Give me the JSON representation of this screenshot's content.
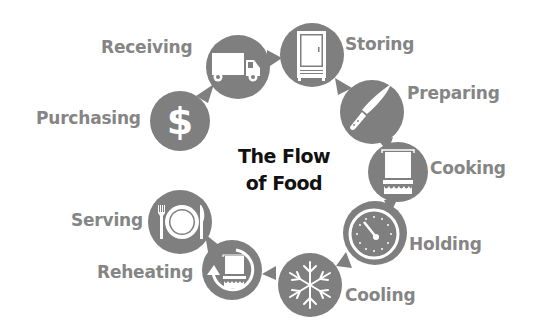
{
  "title": {
    "line1": "The Flow",
    "line2": "of Food"
  },
  "colors": {
    "icon_fill": "#7f7f7f",
    "label_text": "#858585",
    "title_text": "#111111",
    "background": "#ffffff"
  },
  "steps": [
    {
      "label": "Purchasing",
      "icon": "dollar-icon"
    },
    {
      "label": "Receiving",
      "icon": "truck-icon"
    },
    {
      "label": "Storing",
      "icon": "refrigerator-icon"
    },
    {
      "label": "Preparing",
      "icon": "knife-icon"
    },
    {
      "label": "Cooking",
      "icon": "cooking-pot-icon"
    },
    {
      "label": "Holding",
      "icon": "thermometer-gauge-icon"
    },
    {
      "label": "Cooling",
      "icon": "snowflake-icon"
    },
    {
      "label": "Reheating",
      "icon": "reheat-pot-icon"
    },
    {
      "label": "Serving",
      "icon": "plate-utensils-icon"
    }
  ]
}
